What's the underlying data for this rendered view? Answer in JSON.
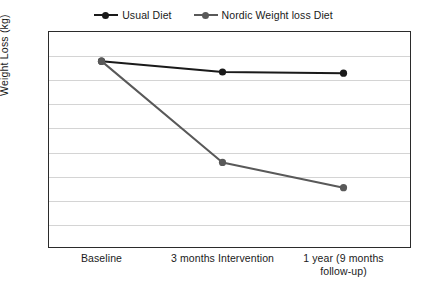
{
  "chart_data": {
    "type": "line",
    "title": "",
    "xlabel": "",
    "ylabel": "Weight Loss (kg)",
    "categories": [
      "Baseline",
      "3 months Intervention",
      "1 year (9 months\nfollow-up)"
    ],
    "ylim": [
      70,
      88
    ],
    "yticks": [
      88,
      86,
      84,
      82,
      80,
      78,
      76,
      74,
      72,
      70
    ],
    "grid": "horizontal",
    "legend_position": "top-center",
    "series": [
      {
        "name": "Usual Diet",
        "color": "#1a1a1a",
        "values": [
          85.5,
          84.6,
          84.5
        ]
      },
      {
        "name": "Nordic Weight loss Diet",
        "color": "#595959",
        "values": [
          85.5,
          77.1,
          75.0
        ]
      }
    ]
  },
  "legend": {
    "items": [
      {
        "label": "Usual Diet",
        "color": "#1a1a1a"
      },
      {
        "label": "Nordic Weight loss Diet",
        "color": "#595959"
      }
    ]
  },
  "axes": {
    "y_title": "Weight Loss (kg)",
    "y_labels": [
      "88",
      "86",
      "84",
      "82",
      "80",
      "78",
      "76",
      "74",
      "72",
      "70"
    ],
    "x_labels": [
      "Baseline",
      "3 months Intervention",
      "1 year (9 months\nfollow-up)"
    ]
  }
}
